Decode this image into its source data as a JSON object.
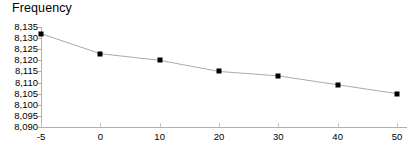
{
  "chart_data": {
    "type": "line",
    "title": "Frequency",
    "xlabel": "",
    "ylabel": "",
    "categories": [
      "-5",
      "0",
      "10",
      "20",
      "30",
      "40",
      "50"
    ],
    "x": [
      -5,
      0,
      10,
      20,
      30,
      40,
      50
    ],
    "values": [
      8132,
      8123,
      8120,
      8115,
      8113,
      8109,
      8105
    ],
    "series": [
      {
        "name": "Frequency",
        "values": [
          8132,
          8123,
          8120,
          8115,
          8113,
          8109,
          8105
        ]
      }
    ],
    "ylim": [
      8090,
      8135
    ],
    "ytick_step": 5,
    "ytick_labels": [
      "8,135",
      "8,130",
      "8,125",
      "8,120",
      "8,115",
      "8,110",
      "8,105",
      "8,100",
      "8,095",
      "8,090"
    ],
    "ytick_values": [
      8135,
      8130,
      8125,
      8120,
      8115,
      8110,
      8105,
      8100,
      8095,
      8090
    ],
    "xtick_labels": [
      "-5",
      "0",
      "10",
      "20",
      "30",
      "40",
      "50"
    ],
    "grid": false,
    "legend": false,
    "legend_position": "none",
    "marker": "square",
    "colors": {
      "line": "#aaaaaa",
      "marker": "#000000",
      "axis": "#b0b0b0",
      "text": "#000000",
      "background": "#ffffff"
    }
  }
}
